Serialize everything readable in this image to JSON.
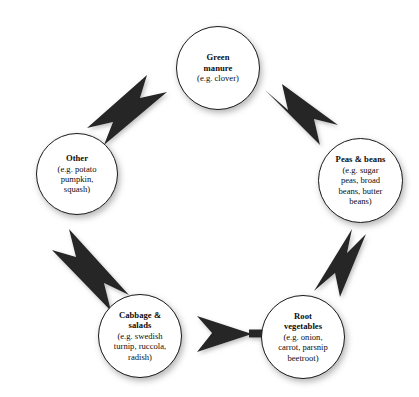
{
  "diagram": {
    "kind": "crop-rotation-cycle",
    "background_color": "#ffffff",
    "node_fill": "#ffffff",
    "node_border_color": "#1a1a1a",
    "arrow_color": "#262626",
    "direction": "clockwise",
    "nodes": [
      {
        "id": "green-manure",
        "title": "Green\nmanure",
        "title_lines": [
          "Green",
          "manure"
        ],
        "example": "(e.g. clover)",
        "example_lines": [
          "(e.g. clover)"
        ],
        "cx": 218,
        "cy": 68,
        "d": 84
      },
      {
        "id": "peas-beans",
        "title": "Peas & beans",
        "title_lines": [
          "Peas & beans"
        ],
        "example": "(e.g. sugar peas, broad beans, butter beans)",
        "example_lines": [
          "(e.g. sugar",
          "peas, broad",
          "beans, butter",
          "beans)"
        ],
        "cx": 360,
        "cy": 180,
        "d": 85
      },
      {
        "id": "root-vegetables",
        "title": "Root vegetables",
        "title_lines": [
          "Root",
          "vegetables"
        ],
        "example": "(e.g. onion, carrot, parsnip beetroot)",
        "example_lines": [
          "(e.g. onion,",
          "carrot, parsnip",
          "beetroot)"
        ],
        "cx": 303,
        "cy": 337,
        "d": 84
      },
      {
        "id": "cabbage-salads",
        "title": "Cabbage & salads",
        "title_lines": [
          "Cabbage &",
          "salads"
        ],
        "example": "(e.g. swedish turnip, ruccola, radish)",
        "example_lines": [
          "(e.g. swedish",
          "turnip, ruccola,",
          "radish)"
        ],
        "cx": 140,
        "cy": 336,
        "d": 84
      },
      {
        "id": "other",
        "title": "Other",
        "title_lines": [
          "Other"
        ],
        "example": "(e.g. potato pumpkin, squash)",
        "example_lines": [
          "(e.g. potato",
          "pumpkin,",
          "squash)"
        ],
        "cx": 77,
        "cy": 174,
        "d": 82
      }
    ],
    "arrows": [
      {
        "id": "arrow-green-manure-to-peas-beans",
        "from": "green-manure",
        "to": "peas-beans",
        "label": ""
      },
      {
        "id": "arrow-peas-beans-to-root-vegetables",
        "from": "peas-beans",
        "to": "root-vegetables",
        "label": ""
      },
      {
        "id": "arrow-root-vegetables-to-cabbage-salads",
        "from": "root-vegetables",
        "to": "cabbage-salads",
        "label": ""
      },
      {
        "id": "arrow-cabbage-salads-to-other",
        "from": "cabbage-salads",
        "to": "other",
        "label": ""
      },
      {
        "id": "arrow-other-to-green-manure",
        "from": "other",
        "to": "green-manure",
        "label": ""
      }
    ]
  }
}
